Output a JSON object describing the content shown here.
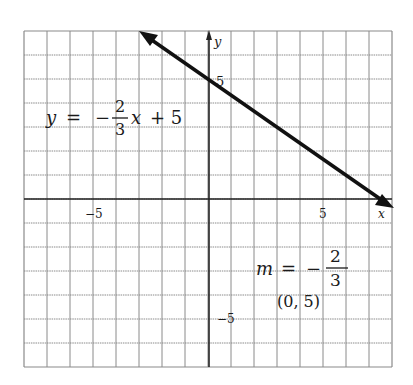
{
  "chart_data": {
    "type": "line",
    "title": "",
    "xlabel": "x",
    "ylabel": "y",
    "xlim": [
      -8,
      8
    ],
    "ylim": [
      -7,
      7
    ],
    "grid": true,
    "tick_labels": {
      "x": [
        {
          "value": -5,
          "label": "−5"
        },
        {
          "value": 5,
          "label": "5"
        }
      ],
      "y": [
        {
          "value": 5,
          "label": "5"
        },
        {
          "value": -5,
          "label": "−5"
        }
      ]
    },
    "series": [
      {
        "name": "y = -2/3 x + 5",
        "slope": -0.6667,
        "intercept": 5,
        "x": [
          -3,
          8
        ],
        "y": [
          7,
          -0.333
        ],
        "arrows": "both",
        "color": "#111111"
      }
    ],
    "annotations": [
      {
        "text": "y = −(2/3)x + 5",
        "parts": {
          "lhs": "y",
          "eq": "=",
          "neg": "−",
          "num": "2",
          "den": "3",
          "var": "x",
          "rest": "+ 5"
        },
        "x": -7,
        "y": 4
      },
      {
        "text": "m = −2/3",
        "parts": {
          "lhs": "m",
          "eq": "=",
          "neg": "−",
          "num": "2",
          "den": "3"
        },
        "x": 2.5,
        "y": -3
      },
      {
        "text": "(0, 5)",
        "x": 4,
        "y": -4.3
      }
    ]
  },
  "axis": {
    "x_label": "x",
    "y_label": "y",
    "x_tick_neg5": "−5",
    "x_tick_5": "5",
    "y_tick_5": "5",
    "y_tick_neg5": "−5"
  },
  "equation": {
    "lhs": "y",
    "eq": "=",
    "neg": "−",
    "num": "2",
    "den": "3",
    "var": "x",
    "rest": "+ 5"
  },
  "slope_label": {
    "lhs": "m",
    "eq": "=",
    "neg": "−",
    "num": "2",
    "den": "3"
  },
  "point_label": "(0, 5)",
  "colors": {
    "grid": "#8a8a8a",
    "axis": "#222222",
    "line": "#111111",
    "text": "#1a1a1a"
  }
}
